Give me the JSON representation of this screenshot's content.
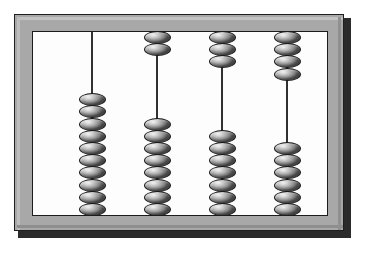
{
  "image": {
    "subject": "abacus",
    "title": "Abacus",
    "background_color": "#ffffff"
  },
  "abacus": {
    "frame_color": "#a8a8a8",
    "frame_outline_color": "#1f1f1f",
    "board_color": "#fdfdfd",
    "rod_color": "#1a1a1a",
    "bead_color": "#b4b4b4",
    "bead_outline_color": "#1b1b1b",
    "bead_highlight_color": "#f2f2f2",
    "rod_count": 4,
    "beads_per_rod": 10,
    "rods": [
      {
        "index": 1,
        "name": "rod-1",
        "x": 58,
        "top_beads": 0,
        "bottom_beads": 10,
        "total_beads": 10,
        "bottom_stack_start_y": 92
      },
      {
        "index": 2,
        "name": "rod-2",
        "x": 123,
        "top_beads": 2,
        "bottom_beads": 8,
        "total_beads": 10,
        "bottom_stack_start_y": 118
      },
      {
        "index": 3,
        "name": "rod-3",
        "x": 188,
        "top_beads": 3,
        "bottom_beads": 7,
        "total_beads": 10,
        "bottom_stack_start_y": 131
      },
      {
        "index": 4,
        "name": "rod-4",
        "x": 253,
        "top_beads": 4,
        "bottom_beads": 6,
        "total_beads": 10,
        "bottom_stack_start_y": 144
      }
    ]
  },
  "chart_data": {
    "type": "bar",
    "categories": [
      "Rod 1",
      "Rod 2",
      "Rod 3",
      "Rod 4"
    ],
    "series": [
      {
        "name": "Top beads",
        "values": [
          0,
          2,
          3,
          4
        ]
      },
      {
        "name": "Bottom beads",
        "values": [
          10,
          8,
          7,
          6
        ]
      }
    ],
    "xlabel": "Rod",
    "ylabel": "Beads",
    "ylim": [
      0,
      10
    ],
    "grid": false,
    "legend": "none"
  }
}
